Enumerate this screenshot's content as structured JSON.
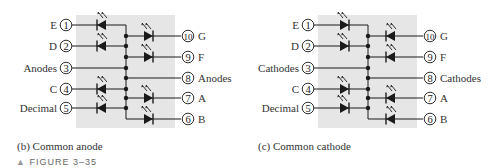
{
  "figure": {
    "label": "FIGURE 3–35",
    "marker": "▲"
  },
  "colors": {
    "package_fill": "#e6e6e6",
    "wire": "#1a1a1a",
    "text": "#333333"
  },
  "diagrams": [
    {
      "id": "common-anode",
      "caption": "(b) Common anode",
      "common_label": "Anodes",
      "led_orientation": "anode-to-bus",
      "left_pins": [
        {
          "num": "1",
          "label": "E"
        },
        {
          "num": "2",
          "label": "D"
        },
        {
          "num": "3",
          "label": "Anodes"
        },
        {
          "num": "4",
          "label": "C"
        },
        {
          "num": "5",
          "label": "Decimal"
        }
      ],
      "right_pins": [
        {
          "num": "10",
          "label": "G"
        },
        {
          "num": "9",
          "label": "F"
        },
        {
          "num": "8",
          "label": "Anodes"
        },
        {
          "num": "7",
          "label": "A"
        },
        {
          "num": "6",
          "label": "B"
        }
      ]
    },
    {
      "id": "common-cathode",
      "caption": "(c) Common cathode",
      "common_label": "Cathodes",
      "led_orientation": "cathode-to-bus",
      "left_pins": [
        {
          "num": "1",
          "label": "E"
        },
        {
          "num": "2",
          "label": "D"
        },
        {
          "num": "3",
          "label": "Cathodes"
        },
        {
          "num": "4",
          "label": "C"
        },
        {
          "num": "5",
          "label": "Decimal"
        }
      ],
      "right_pins": [
        {
          "num": "10",
          "label": "G"
        },
        {
          "num": "9",
          "label": "F"
        },
        {
          "num": "8",
          "label": "Cathodes"
        },
        {
          "num": "7",
          "label": "A"
        },
        {
          "num": "6",
          "label": "B"
        }
      ]
    }
  ]
}
